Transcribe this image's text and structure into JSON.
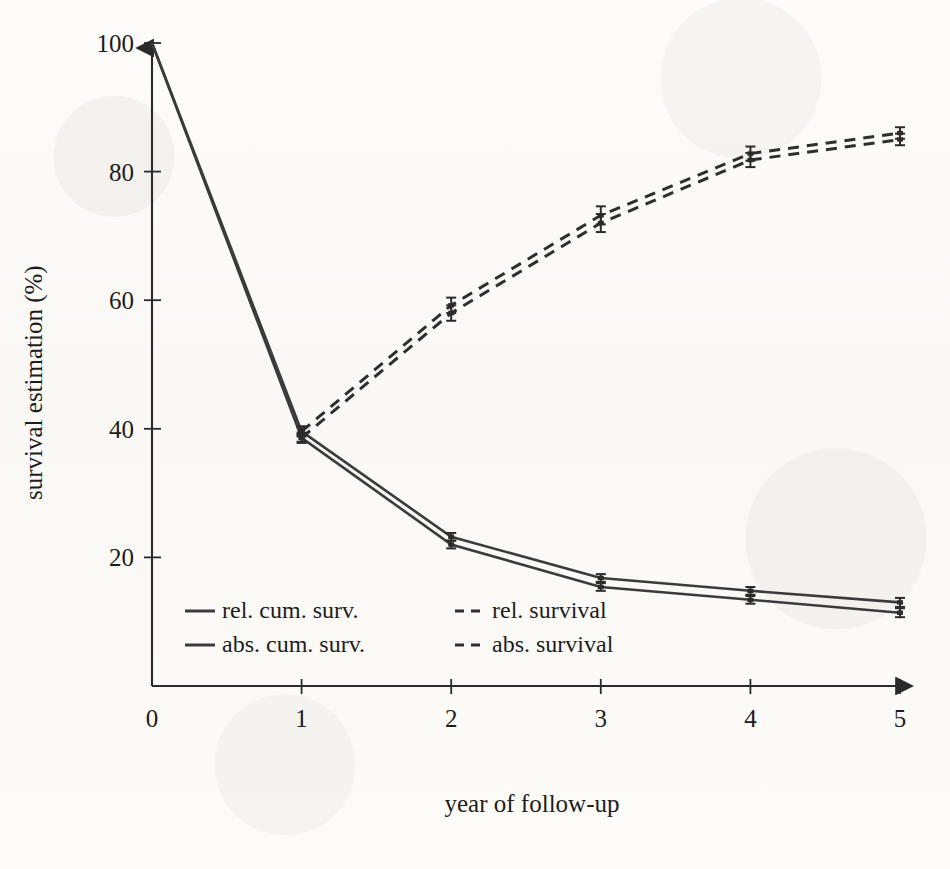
{
  "chart_data": {
    "type": "line",
    "title": "",
    "xlabel": "year of follow-up",
    "ylabel": "survival estimation (%)",
    "xlim": [
      0,
      5
    ],
    "ylim": [
      0,
      100
    ],
    "xticks": [
      "0",
      "1",
      "2",
      "3",
      "4",
      "5"
    ],
    "yticks": [
      "20",
      "40",
      "60",
      "80",
      "100"
    ],
    "grid": false,
    "legend_position": "inside bottom-left",
    "x": [
      0,
      1,
      2,
      3,
      4,
      5
    ],
    "series": [
      {
        "name": "rel. cum. surv.",
        "style": "solid",
        "values": [
          100,
          39.6,
          23.2,
          16.8,
          14.8,
          13.0
        ],
        "errors": [
          0,
          0.6,
          0.6,
          0.6,
          0.6,
          0.7
        ]
      },
      {
        "name": "abs. cum. surv.",
        "style": "solid",
        "values": [
          100,
          38.6,
          22.0,
          15.4,
          13.4,
          11.4
        ],
        "errors": [
          0,
          0.6,
          0.6,
          0.6,
          0.6,
          0.7
        ]
      },
      {
        "name": "rel. survival",
        "style": "dashed",
        "values": [
          null,
          39.6,
          59.2,
          73.2,
          82.8,
          86.0
        ],
        "errors": [
          null,
          0.8,
          1.2,
          1.4,
          1.1,
          0.9
        ]
      },
      {
        "name": "abs. survival",
        "style": "dashed",
        "values": [
          null,
          38.6,
          58.0,
          72.0,
          81.8,
          85.0
        ],
        "errors": [
          null,
          0.8,
          1.2,
          1.4,
          1.1,
          0.9
        ]
      }
    ]
  },
  "axes": {
    "ylabel": "survival estimation (%)",
    "xlabel": "year of follow-up",
    "ytick_labels": [
      "20",
      "40",
      "60",
      "80",
      "100"
    ],
    "xtick_labels": [
      "0",
      "1",
      "2",
      "3",
      "4",
      "5"
    ]
  },
  "legend": {
    "entries": [
      {
        "label": "rel. cum. surv.",
        "style": "solid"
      },
      {
        "label": "rel. survival",
        "style": "dashed"
      },
      {
        "label": "abs. cum. surv.",
        "style": "solid"
      },
      {
        "label": "abs. survival",
        "style": "dashed"
      }
    ]
  },
  "colors": {
    "ink": "#2a2a2a",
    "paper": "#fdfcfa",
    "series_solid": "#3b3b3b",
    "series_dashed": "#2e2e2e"
  }
}
